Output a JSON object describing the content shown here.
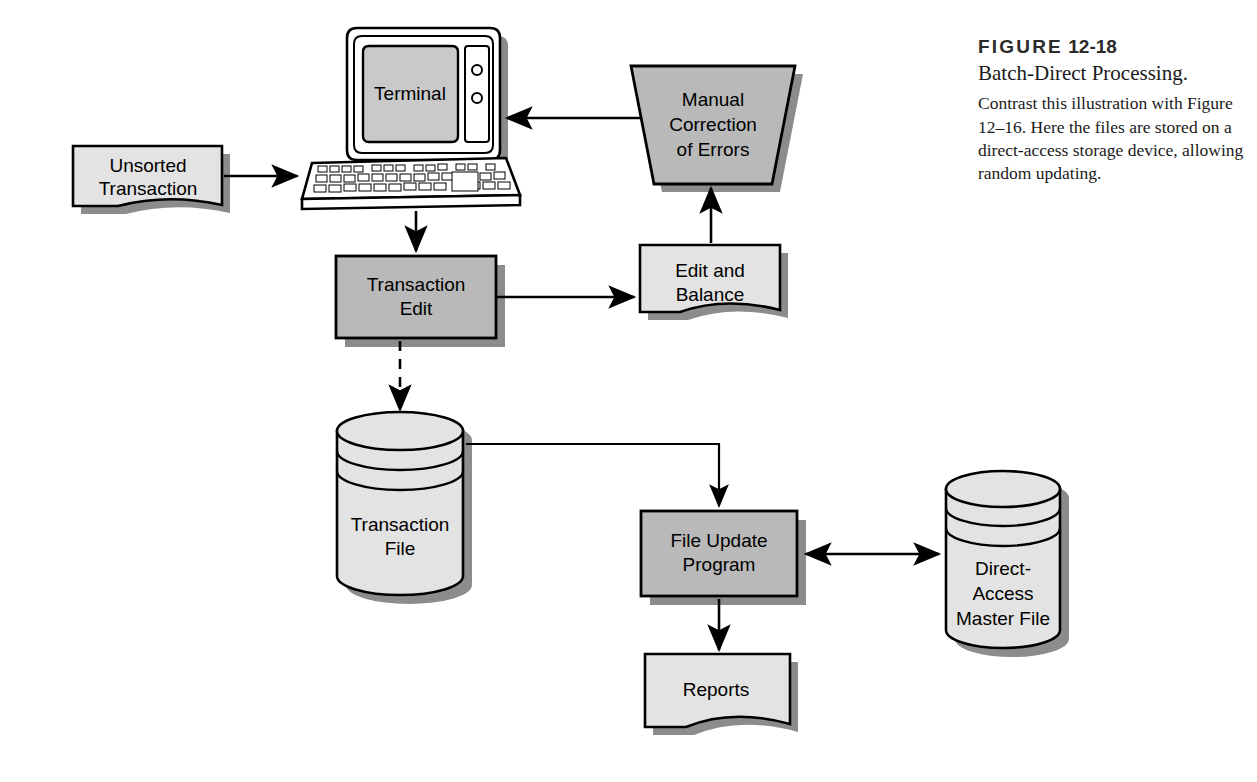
{
  "figure": {
    "label_prefix": "FIGURE",
    "number": "12-18",
    "title": "Batch-Direct Processing.",
    "body": "Contrast this illustration with Figure 12–16. Here the files are stored on a direct-access storage device, allowing random updating."
  },
  "diagram": {
    "type": "flowchart",
    "nodes": [
      {
        "id": "unsorted-transaction",
        "label_line1": "Unsorted",
        "label_line2": "Transaction",
        "shape": "document",
        "fill": "#e3e3e3"
      },
      {
        "id": "terminal",
        "label_line1": "Terminal",
        "label_line2": "",
        "shape": "terminal",
        "fill": "#c9c9c9"
      },
      {
        "id": "manual-correction",
        "label_line1": "Manual",
        "label_line2": "Correction",
        "label_line3": "of Errors",
        "shape": "trapezoid",
        "fill": "#b9b9b9"
      },
      {
        "id": "transaction-edit",
        "label_line1": "Transaction",
        "label_line2": "Edit",
        "shape": "process",
        "fill": "#b9b9b9"
      },
      {
        "id": "edit-and-balance",
        "label_line1": "Edit and",
        "label_line2": "Balance",
        "shape": "document",
        "fill": "#e3e3e3"
      },
      {
        "id": "transaction-file",
        "label_line1": "Transaction",
        "label_line2": "File",
        "shape": "cylinder",
        "fill": "#e3e3e3"
      },
      {
        "id": "file-update-program",
        "label_line1": "File Update",
        "label_line2": "Program",
        "shape": "process",
        "fill": "#b9b9b9"
      },
      {
        "id": "direct-access-master",
        "label_line1": "Direct-",
        "label_line2": "Access",
        "label_line3": "Master File",
        "shape": "cylinder",
        "fill": "#e3e3e3"
      },
      {
        "id": "reports",
        "label_line1": "Reports",
        "label_line2": "",
        "shape": "document",
        "fill": "#e3e3e3"
      }
    ],
    "edges": [
      {
        "from": "unsorted-transaction",
        "to": "terminal",
        "style": "solid",
        "arrow": "single"
      },
      {
        "from": "terminal",
        "to": "transaction-edit",
        "style": "solid",
        "arrow": "single"
      },
      {
        "from": "transaction-edit",
        "to": "edit-and-balance",
        "style": "solid",
        "arrow": "single"
      },
      {
        "from": "edit-and-balance",
        "to": "manual-correction",
        "style": "solid",
        "arrow": "single"
      },
      {
        "from": "manual-correction",
        "to": "terminal",
        "style": "solid",
        "arrow": "single"
      },
      {
        "from": "transaction-edit",
        "to": "transaction-file",
        "style": "dashed",
        "arrow": "single"
      },
      {
        "from": "transaction-file",
        "to": "file-update-program",
        "style": "solid",
        "arrow": "single"
      },
      {
        "from": "file-update-program",
        "to": "direct-access-master",
        "style": "solid",
        "arrow": "double"
      },
      {
        "from": "file-update-program",
        "to": "reports",
        "style": "solid",
        "arrow": "single"
      }
    ],
    "colors": {
      "background": "#ffffff",
      "stroke": "#000000",
      "shadow": "#8c8c8c",
      "fill_process": "#b9b9b9",
      "fill_document": "#e3e3e3",
      "fill_screen": "#c9c9c9"
    }
  }
}
